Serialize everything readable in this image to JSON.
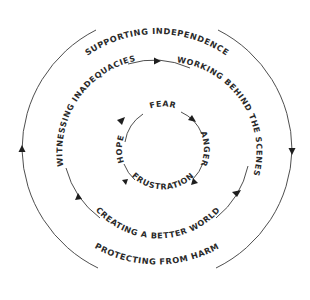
{
  "diagram": {
    "type": "concentric-cycle",
    "outer_ring": {
      "labels": {
        "top": "SUPPORTING INDEPENDENCE",
        "bottom": "PROTECTING FROM HARM"
      },
      "direction": "clockwise"
    },
    "middle_ring": {
      "labels": {
        "upper_left": "WITNESSING INADEQUACIES",
        "upper_right": "WORKING BEHIND THE SCENES",
        "bottom": "CREATING A BETTER WORLD"
      },
      "direction": "clockwise"
    },
    "inner_ring": {
      "labels": {
        "top": "FEAR",
        "right": "ANGER",
        "bottom": "FRUSTRATION",
        "left": "HOPE"
      },
      "direction": "clockwise"
    },
    "colors": {
      "line": "#3a3a3a",
      "text": "#2a2a2a",
      "background": "#ffffff"
    }
  }
}
